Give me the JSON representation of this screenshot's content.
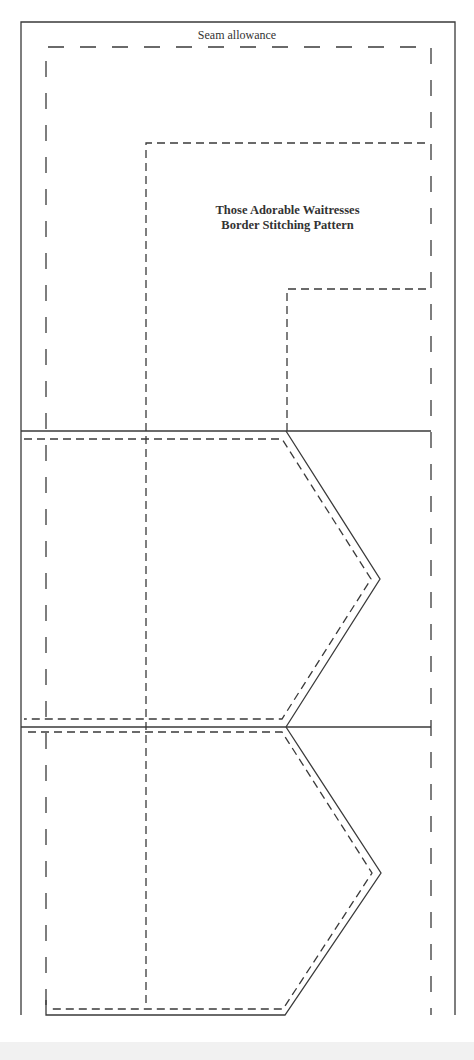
{
  "diagram": {
    "seam_label": "Seam allowance",
    "title_line1": "Those Adorable Waitresses",
    "title_line2": "Border Stitching Pattern",
    "colors": {
      "line": "#3a3a3a",
      "background": "#ffffff"
    }
  }
}
